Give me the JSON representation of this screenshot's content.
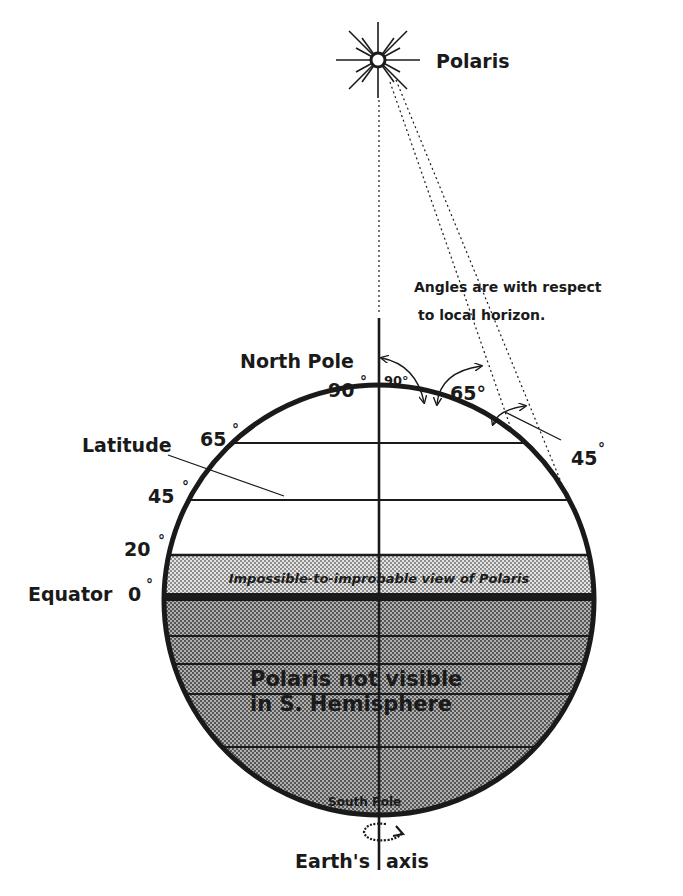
{
  "diagram": {
    "star_label": "Polaris",
    "note_line1": "Angles are with respect",
    "note_line2": "to local horizon.",
    "north_pole_label": "North Pole",
    "south_pole_label": "South Pole",
    "axis_label_left": "Earth's",
    "axis_label_right": "axis",
    "latitude_label": "Latitude",
    "equator_label": "Equator",
    "latitudes": [
      {
        "value": "90",
        "degree": "°"
      },
      {
        "value": "65",
        "degree": "°"
      },
      {
        "value": "45",
        "degree": "°"
      },
      {
        "value": "20",
        "degree": "°"
      },
      {
        "value": "0",
        "degree": "°"
      }
    ],
    "elevation_angles": [
      {
        "value": "90°"
      },
      {
        "value": "65°"
      },
      {
        "value": "45",
        "degree": "°"
      }
    ],
    "band_improbable_label": "Impossible-to-improbable view of Polaris",
    "southern_label_line1": "Polaris not visible",
    "southern_label_line2": "in S. Hemisphere",
    "colors": {
      "ink": "#1a1a1a",
      "improbable_band": "#c8c8c8",
      "southern_hemisphere": "#8a8a8a",
      "background": "#ffffff"
    }
  }
}
